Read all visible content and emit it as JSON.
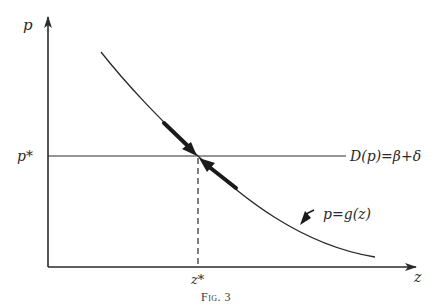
{
  "figure": {
    "caption": "Fig. 3",
    "axes": {
      "y_label": "p",
      "x_label": "z"
    },
    "equilibrium": {
      "p_label": "p*",
      "z_label": "z*"
    },
    "lines": {
      "horizontal_label": "D(p)=β+δ",
      "curve_label": "p=g(z)"
    },
    "colors": {
      "ink": "#2a2a2a",
      "background": "#ffffff"
    }
  }
}
